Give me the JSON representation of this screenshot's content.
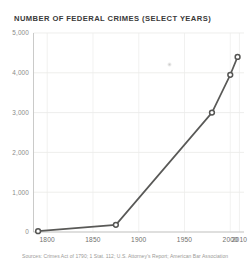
{
  "chart_data": {
    "type": "line",
    "title": "NUMBER OF FEDERAL CRIMES (SELECT YEARS)",
    "xlabel": "",
    "ylabel": "",
    "xlim": [
      1785,
      2015
    ],
    "ylim": [
      0,
      5000
    ],
    "grid": true,
    "legend": "none",
    "x": [
      1790,
      1875,
      1980,
      2000,
      2008
    ],
    "values": [
      20,
      180,
      3000,
      3950,
      4400
    ],
    "series": [
      {
        "name": "Number of federal crimes",
        "x": [
          1790,
          1875,
          1980,
          2000,
          2008
        ],
        "values": [
          20,
          180,
          3000,
          3950,
          4400
        ]
      }
    ],
    "yticks": [
      0,
      1000,
      2000,
      3000,
      4000,
      5000
    ],
    "ytick_labels": [
      "0",
      "1,000",
      "2,000",
      "3,000",
      "4,000",
      "5,000"
    ],
    "xticks": [
      1800,
      1850,
      1900,
      1950,
      2000,
      2010
    ],
    "xtick_labels": [
      "1800",
      "1850",
      "1900",
      "1950",
      "2000",
      "2010"
    ],
    "marker_style": "open-circle",
    "line_color": "#595957",
    "marker_fill": "#ffffff",
    "grid_color": "#e6e6e4"
  },
  "source": {
    "text": "Sources: Crimes Act of 1790; 1 Stat. 112; U.S. Attorney’s Report; American Bar Association"
  },
  "colors": {
    "background": "#ffffff",
    "title": "#3a3a3a",
    "axis_label": "#6f6f6d",
    "accent": "#595957"
  }
}
